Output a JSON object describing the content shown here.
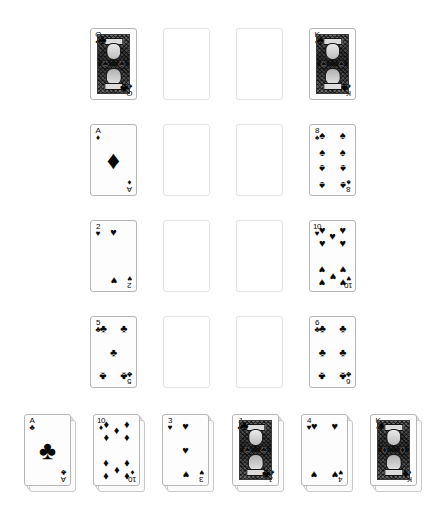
{
  "game": {
    "title": "Solitaire Card Layout",
    "background_color": "#ffffff",
    "card_back_color": "#fdfdfd",
    "card_border_color": "#b6b6b6",
    "empty_slot_border_color": "#e2e2e2",
    "pip_color": "#0a0a0a"
  },
  "suit_glyphs": {
    "spades": "♠",
    "hearts": "♥",
    "diamonds": "♦",
    "clubs": "♣"
  },
  "grid": {
    "rows": 4,
    "columns": 4,
    "card_width": 47,
    "card_height": 72,
    "cells": [
      {
        "row": 0,
        "col": 0,
        "state": "card",
        "rank": "Q",
        "suit": "clubs",
        "face": "court",
        "label": "Queen of Clubs"
      },
      {
        "row": 0,
        "col": 1,
        "state": "empty",
        "rank": "",
        "suit": "",
        "face": "",
        "label": "Empty slot"
      },
      {
        "row": 0,
        "col": 2,
        "state": "empty",
        "rank": "",
        "suit": "",
        "face": "",
        "label": "Empty slot"
      },
      {
        "row": 0,
        "col": 3,
        "state": "card",
        "rank": "K",
        "suit": "spades",
        "face": "court",
        "label": "King of Spades"
      },
      {
        "row": 1,
        "col": 0,
        "state": "card",
        "rank": "A",
        "suit": "diamonds",
        "face": "pip",
        "label": "Ace of Diamonds"
      },
      {
        "row": 1,
        "col": 1,
        "state": "empty",
        "rank": "",
        "suit": "",
        "face": "",
        "label": "Empty slot"
      },
      {
        "row": 1,
        "col": 2,
        "state": "empty",
        "rank": "",
        "suit": "",
        "face": "",
        "label": "Empty slot"
      },
      {
        "row": 1,
        "col": 3,
        "state": "card",
        "rank": "8",
        "suit": "spades",
        "face": "pip",
        "label": "Eight of Spades"
      },
      {
        "row": 2,
        "col": 0,
        "state": "card",
        "rank": "2",
        "suit": "hearts",
        "face": "pip",
        "label": "Two of Hearts"
      },
      {
        "row": 2,
        "col": 1,
        "state": "empty",
        "rank": "",
        "suit": "",
        "face": "",
        "label": "Empty slot"
      },
      {
        "row": 2,
        "col": 2,
        "state": "empty",
        "rank": "",
        "suit": "",
        "face": "",
        "label": "Empty slot"
      },
      {
        "row": 2,
        "col": 3,
        "state": "card",
        "rank": "10",
        "suit": "hearts",
        "face": "pip",
        "label": "Ten of Hearts"
      },
      {
        "row": 3,
        "col": 0,
        "state": "card",
        "rank": "5",
        "suit": "clubs",
        "face": "pip",
        "label": "Five of Clubs"
      },
      {
        "row": 3,
        "col": 1,
        "state": "empty",
        "rank": "",
        "suit": "",
        "face": "",
        "label": "Empty slot"
      },
      {
        "row": 3,
        "col": 2,
        "state": "empty",
        "rank": "",
        "suit": "",
        "face": "",
        "label": "Empty slot"
      },
      {
        "row": 3,
        "col": 3,
        "state": "card",
        "rank": "6",
        "suit": "clubs",
        "face": "pip",
        "label": "Six of Clubs"
      }
    ]
  },
  "tableau": {
    "count": 6,
    "piles": [
      {
        "index": 0,
        "rank": "A",
        "suit": "clubs",
        "face": "pip",
        "depth": 3,
        "label": "Ace of Clubs pile"
      },
      {
        "index": 1,
        "rank": "10",
        "suit": "diamonds",
        "face": "pip",
        "depth": 3,
        "label": "Ten of Diamonds pile"
      },
      {
        "index": 2,
        "rank": "3",
        "suit": "hearts",
        "face": "pip",
        "depth": 3,
        "label": "Three of Hearts pile"
      },
      {
        "index": 3,
        "rank": "J",
        "suit": "clubs",
        "face": "court",
        "depth": 3,
        "label": "Jack of Clubs pile"
      },
      {
        "index": 4,
        "rank": "4",
        "suit": "hearts",
        "face": "pip",
        "depth": 3,
        "label": "Four of Hearts pile"
      },
      {
        "index": 5,
        "rank": "K",
        "suit": "diamonds",
        "face": "court",
        "depth": 3,
        "label": "King of Diamonds pile"
      }
    ]
  }
}
